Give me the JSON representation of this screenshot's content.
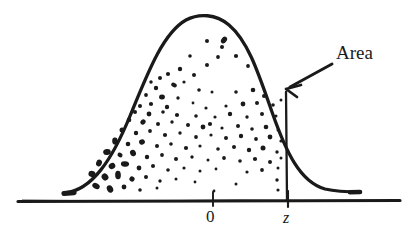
{
  "figure": {
    "name": "standard-normal-curve-area-right-of-z",
    "type": "diagram",
    "style": "hand-drawn sketch, black ink on white",
    "background_color": "#ffffff",
    "ink_color": "#1a1a1a"
  },
  "labels": {
    "area": "Area",
    "tick_zero": "0",
    "tick_z": "z"
  },
  "chart_data": {
    "type": "area",
    "title": "",
    "subtitle": "",
    "xlabel": "",
    "ylabel": "",
    "grid": false,
    "legend": null,
    "annotations": [
      {
        "name": "area-callout",
        "text": "Area",
        "text_position": [
          336,
          43
        ],
        "arrow_from": [
          330,
          66
        ],
        "arrow_to": [
          285,
          89
        ],
        "describes": "region under the curve to the right of z"
      },
      {
        "name": "tick-label-zero",
        "text": "0",
        "axis_position_px": 213
      },
      {
        "name": "tick-label-z",
        "text": "z",
        "axis_position_px": 288
      }
    ],
    "axis": {
      "baseline_y_px": 201,
      "x_start_px": 18,
      "x_end_px": 400,
      "ticks": [
        {
          "label": "0",
          "x_px": 213
        },
        {
          "label": "z",
          "x_px": 288
        }
      ]
    },
    "curve": {
      "description": "bell-shaped normal density curve",
      "peak_px": [
        207,
        17
      ],
      "left_tail_end_px": [
        65,
        193
      ],
      "right_tail_end_px": [
        360,
        192
      ],
      "path": "M 65,193 C 92,190 112,160 130,116 C 148,72 163,33 186,20 C 199,13 216,14 229,25 C 248,41 258,72 272,112 C 286,152 300,182 325,189 C 338,192 350,192 360,192"
    },
    "vertical_line_at_z": {
      "x_px": 286,
      "y_top_px": 92,
      "y_bottom_px": 201
    },
    "stipple": {
      "description": "hand-drawn ink dots filling the region under the curve, densest near the lower-left flank",
      "count": 118,
      "dots": [
        [
          207,
          41,
          2.0
        ],
        [
          224,
          40,
          3.2
        ],
        [
          222,
          47,
          2.0
        ],
        [
          190,
          56,
          1.8
        ],
        [
          218,
          57,
          1.9
        ],
        [
          236,
          56,
          2.1
        ],
        [
          207,
          65,
          2.0
        ],
        [
          180,
          69,
          2.2
        ],
        [
          248,
          66,
          1.9
        ],
        [
          194,
          75,
          2.0
        ],
        [
          160,
          78,
          2.0
        ],
        [
          168,
          74,
          2.1
        ],
        [
          151,
          82,
          1.7
        ],
        [
          174,
          85,
          2.6
        ],
        [
          184,
          82,
          1.6
        ],
        [
          156,
          88,
          2.2
        ],
        [
          199,
          90,
          1.8
        ],
        [
          212,
          92,
          1.5
        ],
        [
          236,
          92,
          1.8
        ],
        [
          253,
          90,
          2.3
        ],
        [
          264,
          96,
          2.0
        ],
        [
          146,
          95,
          1.9
        ],
        [
          162,
          97,
          2.6
        ],
        [
          178,
          98,
          1.7
        ],
        [
          193,
          103,
          1.4
        ],
        [
          151,
          104,
          2.1
        ],
        [
          140,
          106,
          2.0
        ],
        [
          167,
          107,
          2.2
        ],
        [
          206,
          108,
          1.6
        ],
        [
          226,
          106,
          1.6
        ],
        [
          243,
          104,
          2.4
        ],
        [
          257,
          103,
          2.0
        ],
        [
          273,
          105,
          1.8
        ],
        [
          281,
          100,
          1.5
        ],
        [
          135,
          112,
          2.0
        ],
        [
          149,
          114,
          2.4
        ],
        [
          163,
          112,
          1.8
        ],
        [
          177,
          115,
          2.1
        ],
        [
          196,
          116,
          1.8
        ],
        [
          215,
          117,
          1.6
        ],
        [
          230,
          114,
          2.2
        ],
        [
          247,
          117,
          1.7
        ],
        [
          262,
          114,
          2.0
        ],
        [
          276,
          116,
          1.5
        ],
        [
          129,
          120,
          2.3
        ],
        [
          143,
          122,
          2.8
        ],
        [
          158,
          124,
          2.0
        ],
        [
          172,
          122,
          1.7
        ],
        [
          188,
          125,
          2.0
        ],
        [
          203,
          127,
          2.4
        ],
        [
          210,
          124,
          2.1
        ],
        [
          222,
          128,
          1.6
        ],
        [
          238,
          126,
          2.0
        ],
        [
          252,
          129,
          1.8
        ],
        [
          266,
          127,
          2.3
        ],
        [
          278,
          130,
          1.5
        ],
        [
          122,
          130,
          2.5
        ],
        [
          136,
          133,
          2.2
        ],
        [
          150,
          131,
          1.9
        ],
        [
          165,
          135,
          2.1
        ],
        [
          180,
          133,
          1.7
        ],
        [
          196,
          137,
          1.9
        ],
        [
          211,
          135,
          1.6
        ],
        [
          226,
          138,
          2.0
        ],
        [
          241,
          136,
          2.2
        ],
        [
          256,
          139,
          1.9
        ],
        [
          270,
          137,
          2.4
        ],
        [
          281,
          141,
          1.6
        ],
        [
          115,
          141,
          2.8
        ],
        [
          128,
          144,
          2.3
        ],
        [
          142,
          142,
          2.6
        ],
        [
          157,
          146,
          2.0
        ],
        [
          171,
          144,
          1.8
        ],
        [
          186,
          148,
          2.1
        ],
        [
          200,
          146,
          1.6
        ],
        [
          218,
          149,
          1.8
        ],
        [
          234,
          147,
          2.0
        ],
        [
          249,
          150,
          2.2
        ],
        [
          263,
          148,
          2.5
        ],
        [
          277,
          152,
          1.7
        ],
        [
          107,
          152,
          3.0
        ],
        [
          120,
          155,
          2.6
        ],
        [
          133,
          153,
          2.9
        ],
        [
          147,
          157,
          2.2
        ],
        [
          162,
          155,
          1.9
        ],
        [
          176,
          159,
          2.0
        ],
        [
          192,
          157,
          1.7
        ],
        [
          208,
          160,
          1.5
        ],
        [
          224,
          158,
          1.9
        ],
        [
          240,
          161,
          1.8
        ],
        [
          255,
          159,
          2.1
        ],
        [
          270,
          162,
          2.0
        ],
        [
          281,
          158,
          1.5
        ],
        [
          99,
          163,
          3.4
        ],
        [
          112,
          166,
          3.0
        ],
        [
          125,
          164,
          3.2
        ],
        [
          139,
          168,
          2.4
        ],
        [
          153,
          166,
          2.0
        ],
        [
          168,
          170,
          1.8
        ],
        [
          184,
          168,
          1.6
        ],
        [
          200,
          171,
          1.5
        ],
        [
          216,
          169,
          1.4
        ],
        [
          247,
          172,
          1.6
        ],
        [
          262,
          170,
          1.9
        ],
        [
          278,
          168,
          1.5
        ],
        [
          92,
          174,
          3.6
        ],
        [
          105,
          177,
          3.2
        ],
        [
          118,
          175,
          3.4
        ],
        [
          132,
          179,
          2.6
        ],
        [
          146,
          177,
          2.0
        ],
        [
          160,
          181,
          1.7
        ],
        [
          176,
          179,
          1.5
        ],
        [
          195,
          182,
          1.4
        ],
        [
          236,
          184,
          1.5
        ],
        [
          277,
          180,
          1.7
        ],
        [
          96,
          186,
          3.4
        ],
        [
          110,
          189,
          3.0
        ],
        [
          124,
          187,
          2.4
        ],
        [
          140,
          190,
          1.8
        ],
        [
          157,
          188,
          1.5
        ],
        [
          214,
          191,
          1.4
        ],
        [
          278,
          190,
          1.6
        ]
      ]
    }
  }
}
